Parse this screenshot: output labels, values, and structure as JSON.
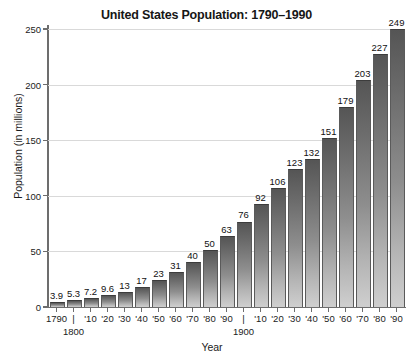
{
  "chart_data": {
    "type": "bar",
    "title": "United States Population: 1790–1990",
    "xlabel": "Year",
    "ylabel": "Population (in millions)",
    "ylim": [
      0,
      250
    ],
    "ytick_values": [
      0,
      50,
      100,
      150,
      200,
      250
    ],
    "ytick_labels": [
      "0",
      "50",
      "100",
      "150",
      "200",
      "250"
    ],
    "grid": true,
    "legend": "none",
    "categories": [
      "1790",
      "1800",
      "1810",
      "1820",
      "1830",
      "1840",
      "1850",
      "1860",
      "1870",
      "1880",
      "1890",
      "1900",
      "1910",
      "1920",
      "1930",
      "1940",
      "1950",
      "1960",
      "1970",
      "1980",
      "1990"
    ],
    "xtick_labels": [
      "1790",
      "|",
      "'10",
      "'20",
      "'30",
      "'40",
      "'50",
      "'60",
      "'70",
      "'80",
      "'90",
      "|",
      "'10",
      "'20",
      "'30",
      "'40",
      "'50",
      "'60",
      "'70",
      "'80",
      "'90"
    ],
    "xtick_sublabels": [
      "",
      "1800",
      "",
      "",
      "",
      "",
      "",
      "",
      "",
      "",
      "",
      "1900",
      "",
      "",
      "",
      "",
      "",
      "",
      "",
      "",
      ""
    ],
    "values": [
      3.9,
      5.3,
      7.2,
      9.6,
      13,
      17,
      23,
      31,
      40,
      50,
      63,
      76,
      92,
      106,
      123,
      132,
      151,
      179,
      203,
      227,
      249
    ],
    "value_labels": [
      "3.9",
      "5.3",
      "7.2",
      "9.6",
      "13",
      "17",
      "23",
      "31",
      "40",
      "50",
      "63",
      "76",
      "92",
      "106",
      "123",
      "132",
      "151",
      "179",
      "203",
      "227",
      "249"
    ],
    "bar_color_top": "#555555",
    "bar_color_bottom": "#cfcfcf",
    "gridline_color": "#d9d9d9",
    "axis_color": "#6d6d6d",
    "background_color": "#ffffff"
  }
}
